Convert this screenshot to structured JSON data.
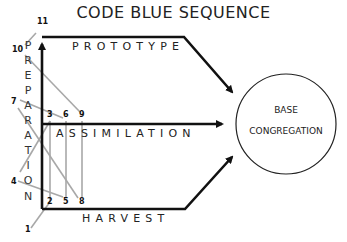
{
  "title": "CODE BLUE SEQUENCE",
  "tracks": {
    "top": "PROTOTYPE",
    "middle": "ASSIMILATION",
    "bottom": "HARVEST"
  },
  "vertical_label": "PREPARATION",
  "vertical_letters": [
    "P",
    "R",
    "E",
    "P",
    "A",
    "R",
    "A",
    "T",
    "I",
    "O",
    "N"
  ],
  "target": {
    "line1": "BASE",
    "line2": "CONGREGATION"
  },
  "sequence_numbers": {
    "n1": "1",
    "n2": "2",
    "n3": "3",
    "n4": "4",
    "n5": "5",
    "n6": "6",
    "n7": "7",
    "n8": "8",
    "n9": "9",
    "n10": "10",
    "n11": "11"
  },
  "colors": {
    "main_line": "#111111",
    "sequence_line": "#a8a8a8"
  }
}
